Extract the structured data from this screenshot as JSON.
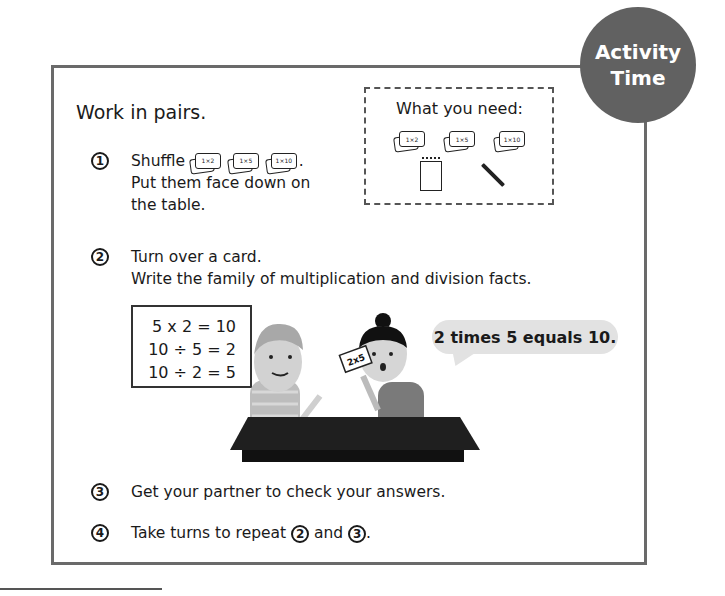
{
  "badge": {
    "line1": "Activity",
    "line2": "Time"
  },
  "heading": "Work in pairs.",
  "what_you_need": {
    "title": "What you need:",
    "items": [
      {
        "type": "card-set",
        "label": "1×2"
      },
      {
        "type": "card-set",
        "label": "1×5"
      },
      {
        "type": "card-set",
        "label": "1×10"
      },
      {
        "type": "notepad-icon",
        "label": ""
      },
      {
        "type": "pencil-icon",
        "label": ""
      }
    ]
  },
  "steps": [
    {
      "number": "1",
      "text_before": "Shuffle",
      "cards": [
        "1×2",
        "1×5",
        "1×10"
      ],
      "text_after": ".",
      "line2": "Put them face down on",
      "line3": "the table."
    },
    {
      "number": "2",
      "line1": "Turn over a card.",
      "line2": "Write the family of multiplication and division facts."
    },
    {
      "number": "3",
      "line1": "Get your partner to check your answers."
    },
    {
      "number": "4",
      "text_before": "Take turns to repeat",
      "ref1": "2",
      "middle": "and",
      "ref2": "3",
      "text_after": "."
    }
  ],
  "facts": [
    "5 x 2 = 10",
    "10 ÷ 5 = 2",
    "10 ÷ 2 = 5"
  ],
  "illustration": {
    "held_card": "2x5",
    "speech_bubble": "2 times 5 equals 10."
  },
  "colors": {
    "badge": "#616161",
    "frame": "#6a6a6a",
    "bubble": "#e2e2e2",
    "table": "#1e1e1e"
  }
}
